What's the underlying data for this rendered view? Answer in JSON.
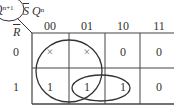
{
  "kmap": {
    "output_var": "Q",
    "output_sup": "n+1",
    "col_var_1": "S",
    "col_var_2": "Q",
    "col_var_2_sup": "n",
    "row_var": "R",
    "col_headers": [
      "00",
      "01",
      "10",
      "11"
    ],
    "row_headers": [
      "0",
      "1"
    ],
    "cells": [
      [
        "×",
        "×",
        "0",
        "0"
      ],
      [
        "1",
        "1",
        "1",
        "0"
      ]
    ],
    "groups": [
      {
        "name": "group-large",
        "covers": "columns 00 and 01, both rows"
      },
      {
        "name": "group-small",
        "covers": "row 1, columns 01 and 10"
      }
    ]
  }
}
